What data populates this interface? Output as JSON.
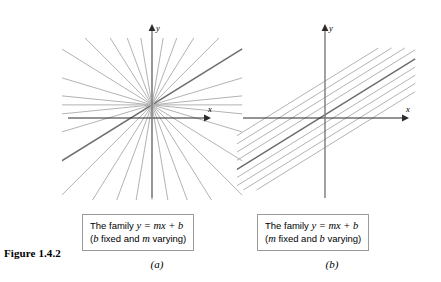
{
  "figure": {
    "label": "Figure 1.4.2",
    "background_color": "#ffffff",
    "axis_color": "#2b2b2b",
    "line_color": "#b3b3b3",
    "highlight_line_color": "#6e6e6e",
    "caption_border_color": "#9a9a9a"
  },
  "panels": [
    {
      "id": "a",
      "sub_label": "(a)",
      "axis_labels": {
        "x": "x",
        "y": "y"
      },
      "caption": {
        "line1_prefix": "The family ",
        "line1_equation": "y = mx + b",
        "line2_open": "(",
        "line2_var1": "b",
        "line2_mid": " fixed and ",
        "line2_var2": "m",
        "line2_end": " varying)"
      }
    },
    {
      "id": "b",
      "sub_label": "(b)",
      "axis_labels": {
        "x": "x",
        "y": "y"
      },
      "caption": {
        "line1_prefix": "The family ",
        "line1_equation": "y = mx + b",
        "line2_open": "(",
        "line2_var1": "m",
        "line2_mid": " fixed and ",
        "line2_var2": "b",
        "line2_end": " varying)"
      }
    }
  ],
  "chart_data": [
    {
      "type": "line",
      "title": "The family y = mx + b (b fixed and m varying)",
      "panel": "a",
      "description": "Pencil of concurrent lines through a common point above the origin; b held fixed while slope m varies.",
      "xlabel": "x",
      "ylabel": "y",
      "grid": false,
      "legend": "none",
      "xlim": [
        -10,
        10
      ],
      "ylim": [
        -10,
        10
      ],
      "concurrency_point": [
        0,
        1.6
      ],
      "fixed_parameter": {
        "name": "b",
        "value": 1.6
      },
      "varying_parameter": {
        "name": "m"
      },
      "series": [
        {
          "name": "m = 0.10",
          "slope": 0.1,
          "intercept": 1.6,
          "highlight": false
        },
        {
          "name": "m = 0.30",
          "slope": 0.3,
          "intercept": 1.6,
          "highlight": false
        },
        {
          "name": "m = 0.62",
          "slope": 0.62,
          "intercept": 1.6,
          "highlight": true
        },
        {
          "name": "m = 1.00",
          "slope": 1.0,
          "intercept": 1.6,
          "highlight": false
        },
        {
          "name": "m = 1.60",
          "slope": 1.6,
          "intercept": 1.6,
          "highlight": false
        },
        {
          "name": "m = 2.70",
          "slope": 2.7,
          "intercept": 1.6,
          "highlight": false
        },
        {
          "name": "m = 6.00",
          "slope": 6.0,
          "intercept": 1.6,
          "highlight": false
        },
        {
          "name": "m = vertical",
          "slope": null,
          "intercept": 1.6,
          "highlight": false
        },
        {
          "name": "m = -6.00",
          "slope": -6.0,
          "intercept": 1.6,
          "highlight": false
        },
        {
          "name": "m = -2.70",
          "slope": -2.7,
          "intercept": 1.6,
          "highlight": false
        },
        {
          "name": "m = -1.60",
          "slope": -1.6,
          "intercept": 1.6,
          "highlight": false
        },
        {
          "name": "m = -1.00",
          "slope": -1.0,
          "intercept": 1.6,
          "highlight": false
        },
        {
          "name": "m = -0.62",
          "slope": -0.62,
          "intercept": 1.6,
          "highlight": false
        },
        {
          "name": "m = -0.30",
          "slope": -0.3,
          "intercept": 1.6,
          "highlight": false
        },
        {
          "name": "m = -0.10",
          "slope": -0.1,
          "intercept": 1.6,
          "highlight": false
        },
        {
          "name": "m = 0.00",
          "slope": 0.0,
          "intercept": 1.6,
          "highlight": false
        }
      ]
    },
    {
      "type": "line",
      "title": "The family y = mx + b (m fixed and b varying)",
      "panel": "b",
      "description": "Family of parallel lines of equal slope; m held fixed while intercept b varies.",
      "xlabel": "x",
      "ylabel": "y",
      "grid": false,
      "legend": "none",
      "xlim": [
        -10,
        10
      ],
      "ylim": [
        -10,
        10
      ],
      "fixed_parameter": {
        "name": "m",
        "value": 0.62
      },
      "varying_parameter": {
        "name": "b"
      },
      "series": [
        {
          "name": "b = 4.5",
          "slope": 0.62,
          "intercept": 4.5,
          "highlight": false
        },
        {
          "name": "b = 3.5",
          "slope": 0.62,
          "intercept": 3.5,
          "highlight": false
        },
        {
          "name": "b = 2.5",
          "slope": 0.62,
          "intercept": 2.5,
          "highlight": false
        },
        {
          "name": "b = 1.5",
          "slope": 0.62,
          "intercept": 1.5,
          "highlight": false
        },
        {
          "name": "b = 0.4",
          "slope": 0.62,
          "intercept": 0.4,
          "highlight": true
        },
        {
          "name": "b = -0.6",
          "slope": 0.62,
          "intercept": -0.6,
          "highlight": false
        },
        {
          "name": "b = -1.6",
          "slope": 0.62,
          "intercept": -1.6,
          "highlight": false
        },
        {
          "name": "b = -2.6",
          "slope": 0.62,
          "intercept": -2.6,
          "highlight": false
        },
        {
          "name": "b = -3.6",
          "slope": 0.62,
          "intercept": -3.6,
          "highlight": false
        }
      ]
    }
  ]
}
